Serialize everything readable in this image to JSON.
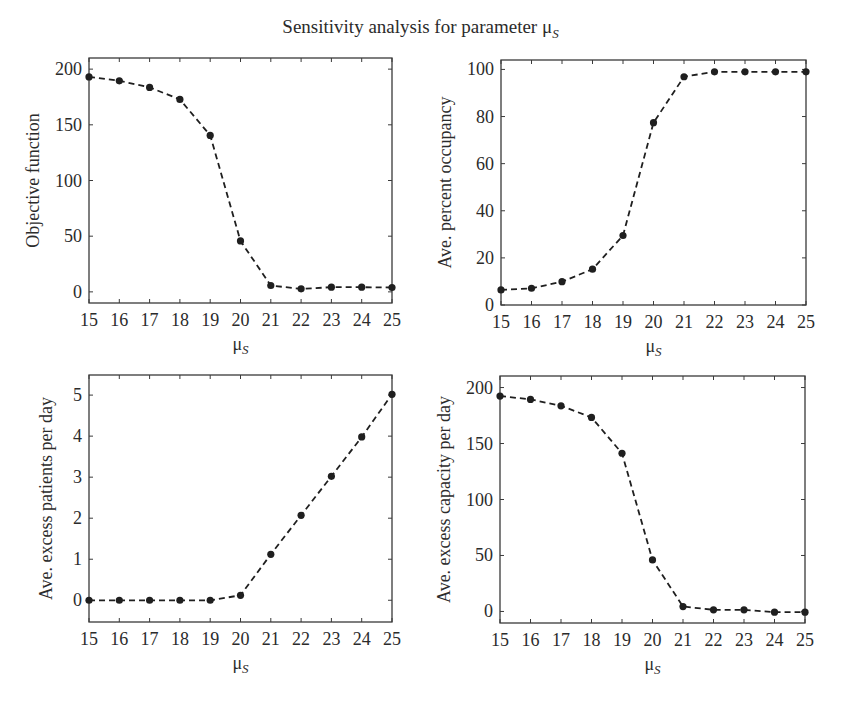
{
  "figure": {
    "title_main": "Sensitivity analysis for parameter μ",
    "title_sub": "S",
    "line_color": "#1f1f1f",
    "axes_color": "#3a3a3a"
  },
  "chart_data": [
    {
      "type": "line",
      "id": "objective",
      "title": "",
      "xlabel": "μS",
      "xlabel_main": "μ",
      "xlabel_sub": "S",
      "ylabel": "Objective function",
      "x": [
        15,
        16,
        17,
        18,
        19,
        20,
        21,
        22,
        23,
        24,
        25
      ],
      "series": [
        {
          "name": "Objective function",
          "values": [
            193,
            189.5,
            183.6,
            172.8,
            140.5,
            45.7,
            5.7,
            2.7,
            4.2,
            4.2,
            3.9
          ]
        }
      ],
      "xlim": [
        15,
        25
      ],
      "ylim": [
        -10,
        210
      ],
      "xticks": [
        15,
        16,
        17,
        18,
        19,
        20,
        21,
        22,
        23,
        24,
        25
      ],
      "yticks": [
        0,
        50,
        100,
        150,
        200
      ],
      "style": {
        "line": "dashed",
        "marker": "circle"
      },
      "grid": false,
      "legend": "none",
      "box": {
        "x0": 89,
        "x1": 392,
        "y0": 58,
        "y1": 303
      }
    },
    {
      "type": "line",
      "id": "occupancy",
      "title": "",
      "xlabel": "μS",
      "xlabel_main": "μ",
      "xlabel_sub": "S",
      "ylabel": "Ave. percent occupancy",
      "x": [
        15,
        16,
        17,
        18,
        19,
        20,
        21,
        22,
        23,
        24,
        25
      ],
      "series": [
        {
          "name": "Ave. percent occupancy",
          "values": [
            6.4,
            7.1,
            9.9,
            15.2,
            29.5,
            77.4,
            96.9,
            99.0,
            99.0,
            99.0,
            99.0
          ]
        }
      ],
      "xlim": [
        15,
        25
      ],
      "ylim": [
        0,
        104
      ],
      "xticks": [
        15,
        16,
        17,
        18,
        19,
        20,
        21,
        22,
        23,
        24,
        25
      ],
      "yticks": [
        0,
        20,
        40,
        60,
        80,
        100
      ],
      "style": {
        "line": "dashed",
        "marker": "circle"
      },
      "grid": false,
      "legend": "none",
      "box": {
        "x0": 501,
        "x1": 806,
        "y0": 60,
        "y1": 305
      }
    },
    {
      "type": "line",
      "id": "excess-patients",
      "title": "",
      "xlabel": "μS",
      "xlabel_main": "μ",
      "xlabel_sub": "S",
      "ylabel": "Ave. excess patients per day",
      "x": [
        15,
        16,
        17,
        18,
        19,
        20,
        21,
        22,
        23,
        24,
        25
      ],
      "series": [
        {
          "name": "Ave. excess patients per day",
          "values": [
            0,
            0,
            0,
            0,
            0,
            0.12,
            1.12,
            2.07,
            3.02,
            3.98,
            5.02
          ]
        }
      ],
      "xlim": [
        15,
        25
      ],
      "ylim": [
        -0.53,
        5.49
      ],
      "xticks": [
        15,
        16,
        17,
        18,
        19,
        20,
        21,
        22,
        23,
        24,
        25
      ],
      "yticks": [
        0,
        1,
        2,
        3,
        4,
        5
      ],
      "style": {
        "line": "dashed",
        "marker": "circle"
      },
      "grid": false,
      "legend": "none",
      "box": {
        "x0": 89,
        "x1": 392,
        "y0": 375,
        "y1": 622
      }
    },
    {
      "type": "line",
      "id": "excess-capacity",
      "title": "",
      "xlabel": "μS",
      "xlabel_main": "μ",
      "xlabel_sub": "S",
      "ylabel": "Ave. excess capacity per day",
      "x": [
        15,
        16,
        17,
        18,
        19,
        20,
        21,
        22,
        23,
        24,
        25
      ],
      "series": [
        {
          "name": "Ave. excess capacity per day",
          "values": [
            192.4,
            189.4,
            183.7,
            173.3,
            141.3,
            46,
            4.4,
            1.5,
            1.5,
            -0.6,
            -0.6
          ]
        }
      ],
      "xlim": [
        15,
        25
      ],
      "ylim": [
        -10.3,
        210.3
      ],
      "xticks": [
        15,
        16,
        17,
        18,
        19,
        20,
        21,
        22,
        23,
        24,
        25
      ],
      "yticks": [
        0,
        50,
        100,
        150,
        200
      ],
      "style": {
        "line": "dashed",
        "marker": "circle"
      },
      "grid": false,
      "legend": "none",
      "box": {
        "x0": 500,
        "x1": 805,
        "y0": 376,
        "y1": 623
      }
    }
  ]
}
